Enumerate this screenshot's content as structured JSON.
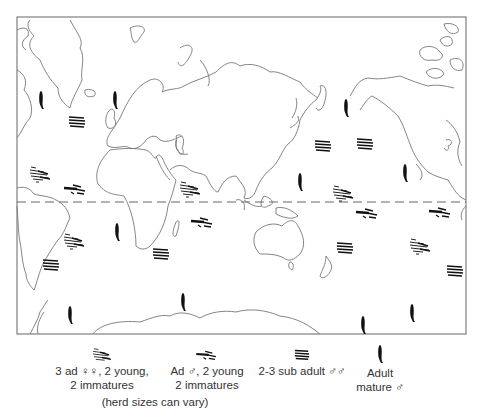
{
  "figure": {
    "type": "world map of whale herd distribution",
    "equator_line": "dashed",
    "colors": {
      "coast": "#777777",
      "frame": "#666666",
      "marker": "#111111",
      "equator": "#666666"
    }
  },
  "legend": {
    "items": [
      {
        "icon": "mixed-herd-icon",
        "line1": "3 ad ♀♀, 2 young,",
        "line2": "2 immatures"
      },
      {
        "icon": "male-herd-icon",
        "line1": "Ad ♂, 2 young",
        "line2": "2 immatures"
      },
      {
        "icon": "subadult-group-icon",
        "line1": "2-3 sub adult ♂♂",
        "line2": ""
      },
      {
        "icon": "single-whale-icon",
        "line1": "Adult",
        "line2": "mature ♂"
      }
    ],
    "note": "(herd sizes can vary)"
  },
  "markers": {
    "single_adult_male": [
      [
        41,
        100
      ],
      [
        115,
        100
      ],
      [
        346,
        108
      ],
      [
        117,
        232
      ],
      [
        183,
        302
      ],
      [
        300,
        182
      ],
      [
        405,
        173
      ],
      [
        70,
        315
      ],
      [
        363,
        325
      ],
      [
        412,
        313
      ]
    ],
    "subadult_males": [
      [
        77,
        121
      ],
      [
        323,
        145
      ],
      [
        365,
        143
      ],
      [
        161,
        253
      ],
      [
        51,
        264
      ],
      [
        345,
        247
      ],
      [
        455,
        270
      ]
    ],
    "mixed_female_herd": [
      [
        40,
        173
      ],
      [
        74,
        240
      ],
      [
        190,
        188
      ],
      [
        343,
        192
      ],
      [
        420,
        245
      ]
    ],
    "adult_male_herd": [
      [
        75,
        188
      ],
      [
        202,
        221
      ],
      [
        367,
        212
      ],
      [
        440,
        211
      ]
    ]
  }
}
